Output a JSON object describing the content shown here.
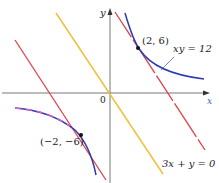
{
  "labels": {
    "y_axis": "y",
    "x_axis": "x",
    "origin": "0",
    "point1": "(2, 6)",
    "point2": "(−2, −6)",
    "curve": "xy = 12",
    "line": "3x + y = 0"
  },
  "colors": {
    "hyperbola": "#2b3bb0",
    "tangent_lines": "#e0404a",
    "line_3x_y": "#f2c038",
    "dashed_accent": "#e060c0"
  }
}
